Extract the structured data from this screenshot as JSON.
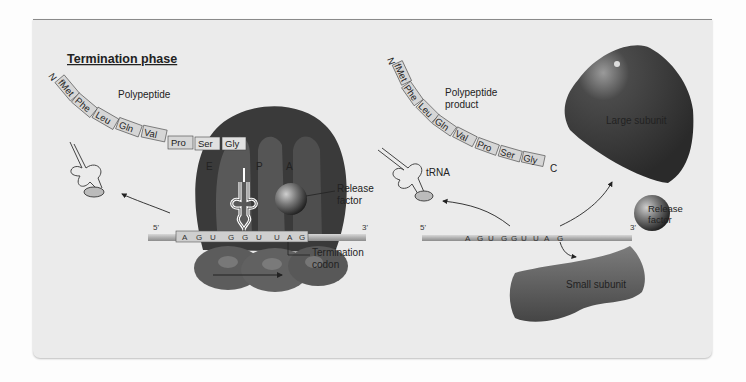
{
  "title": "Termination phase",
  "left": {
    "polypeptide_label": "Polypeptide",
    "n_terminus": "N",
    "amino_acids": [
      "fMet",
      "Phe",
      "Leu",
      "Gln",
      "Val",
      "Pro",
      "Ser",
      "Gly"
    ],
    "sites": {
      "E": "E",
      "P": "P",
      "A": "A"
    },
    "release_factor_label": [
      "Release",
      "factor"
    ],
    "mrna": {
      "five_prime": "5'",
      "three_prime": "3'",
      "codons": [
        "A",
        "G",
        "U",
        "G",
        "G",
        "U",
        "U",
        "A",
        "G"
      ]
    },
    "termination_codon_label": [
      "Termination",
      "codon"
    ]
  },
  "right": {
    "polypeptide_label": [
      "Polypeptide",
      "product"
    ],
    "n_terminus": "N",
    "c_terminus": "C",
    "amino_acids": [
      "fMet",
      "Phe",
      "Leu",
      "Gln",
      "Val",
      "Pro",
      "Ser",
      "Gly"
    ],
    "trna_label": "tRNA",
    "large_subunit_label": "Large subunit",
    "small_subunit_label": "Small subunit",
    "release_factor_label": [
      "Release",
      "factor"
    ],
    "mrna": {
      "five_prime": "5'",
      "three_prime": "3'",
      "codons": [
        "A",
        "G",
        "U",
        "G",
        "G",
        "U",
        "U",
        "A",
        "G"
      ]
    }
  },
  "colors": {
    "panel": "#ebebeb",
    "ribosome_dark": "#3a3a3a",
    "ribosome_mid": "#6a6a6a",
    "mrna": "#b8b8b8",
    "aa_box": "#d6d6d6"
  }
}
